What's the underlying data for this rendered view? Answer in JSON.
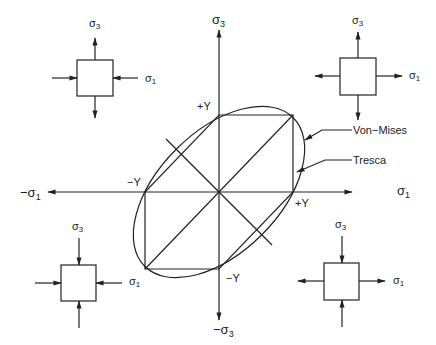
{
  "diagram": {
    "colors": {
      "ink": "#222222",
      "background": "#ffffff"
    },
    "axes": {
      "pos_sigma1": "σ",
      "pos_sigma1_sub": "1",
      "neg_sigma1": "−σ",
      "neg_sigma1_sub": "1",
      "pos_sigma3": "σ",
      "pos_sigma3_sub": "3",
      "neg_sigma3": "−σ",
      "neg_sigma3_sub": "3"
    },
    "points": {
      "top_plus_y": "+Y",
      "right_plus_y": "+Y",
      "left_minus_y": "−Y",
      "bottom_minus_y": "−Y"
    },
    "curves": {
      "von_mises": "Von−Mises",
      "tresca": "Tresca"
    },
    "stress_elements": [
      {
        "id": "top-left",
        "sigma3_label": "σ",
        "sigma3_sub": "3",
        "sigma1_label": "σ",
        "sigma1_sub": "1",
        "sigma3_state": "tension",
        "sigma1_state": "compression"
      },
      {
        "id": "top-right",
        "sigma3_label": "σ",
        "sigma3_sub": "3",
        "sigma1_label": "σ",
        "sigma1_sub": "1",
        "sigma3_state": "tension",
        "sigma1_state": "tension"
      },
      {
        "id": "bottom-left",
        "sigma3_label": "σ",
        "sigma3_sub": "3",
        "sigma1_label": "σ",
        "sigma1_sub": "1",
        "sigma3_state": "compression",
        "sigma1_state": "compression"
      },
      {
        "id": "bottom-right",
        "sigma3_label": "σ",
        "sigma3_sub": "3",
        "sigma1_label": "σ",
        "sigma1_sub": "1",
        "sigma3_state": "compression",
        "sigma1_state": "tension"
      }
    ]
  }
}
